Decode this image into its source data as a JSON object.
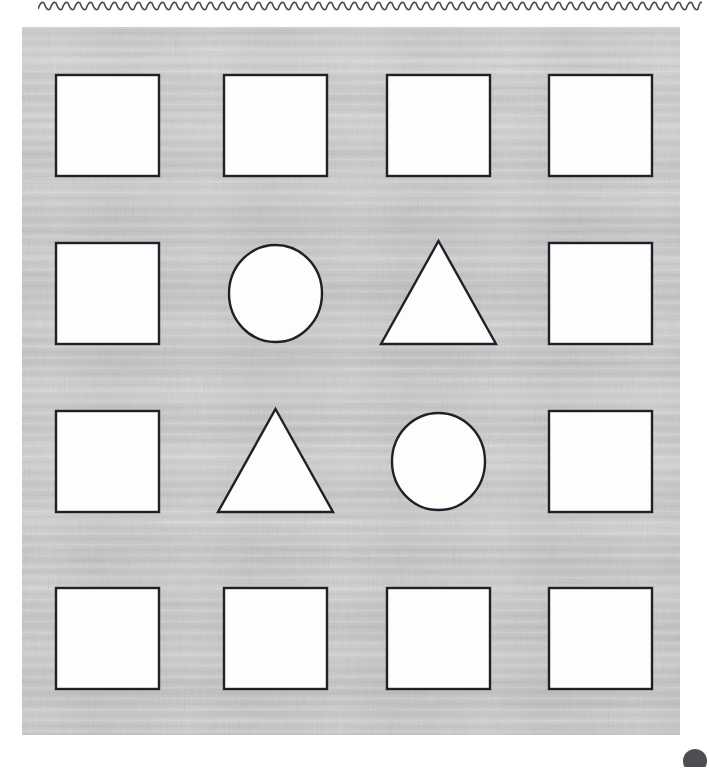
{
  "worksheet": {
    "title": "Shape grid worksheet",
    "canvas": {
      "width": 709,
      "height": 765,
      "background_color": "#ffffff"
    },
    "decorations": {
      "top_rule": {
        "name": "wavy-rule",
        "style": "wavy",
        "color": "#4a4a52",
        "x_start": 38,
        "x_end": 702,
        "y": 6,
        "amplitude": 3,
        "wavelength": 12
      },
      "page_marker": {
        "name": "page-marker-dot",
        "shape": "circle",
        "color": "#4d4d52",
        "center_x": 695,
        "center_y": 761,
        "radius": 12
      }
    },
    "panel": {
      "name": "texture-panel",
      "x": 22,
      "y": 27,
      "width": 658,
      "height": 708,
      "fill_color": "#c8c8c8",
      "texture": "horizontal-streaked-gray"
    },
    "grid": {
      "rows": 4,
      "columns": 4,
      "column_x": [
        56,
        224,
        387,
        549
      ],
      "row_y": [
        75,
        243,
        411,
        588
      ],
      "cell_width": 103,
      "cell_height": 101,
      "stroke_color": "#20202a",
      "fill_color": "#fdfdfd",
      "stroke_width": 2.4
    },
    "cells": [
      {
        "row": 1,
        "col": 1,
        "shape": "square",
        "label": "square"
      },
      {
        "row": 1,
        "col": 2,
        "shape": "square",
        "label": "square"
      },
      {
        "row": 1,
        "col": 3,
        "shape": "square",
        "label": "square"
      },
      {
        "row": 1,
        "col": 4,
        "shape": "square",
        "label": "square"
      },
      {
        "row": 2,
        "col": 1,
        "shape": "square",
        "label": "square"
      },
      {
        "row": 2,
        "col": 2,
        "shape": "circle",
        "label": "circle"
      },
      {
        "row": 2,
        "col": 3,
        "shape": "triangle",
        "label": "triangle"
      },
      {
        "row": 2,
        "col": 4,
        "shape": "square",
        "label": "square"
      },
      {
        "row": 3,
        "col": 1,
        "shape": "square",
        "label": "square"
      },
      {
        "row": 3,
        "col": 2,
        "shape": "triangle",
        "label": "triangle"
      },
      {
        "row": 3,
        "col": 3,
        "shape": "circle",
        "label": "circle"
      },
      {
        "row": 3,
        "col": 4,
        "shape": "square",
        "label": "square"
      },
      {
        "row": 4,
        "col": 1,
        "shape": "square",
        "label": "square"
      },
      {
        "row": 4,
        "col": 2,
        "shape": "square",
        "label": "square"
      },
      {
        "row": 4,
        "col": 3,
        "shape": "square",
        "label": "square"
      },
      {
        "row": 4,
        "col": 4,
        "shape": "square",
        "label": "square"
      }
    ],
    "shape_counts": {
      "square": 12,
      "circle": 2,
      "triangle": 2
    }
  }
}
